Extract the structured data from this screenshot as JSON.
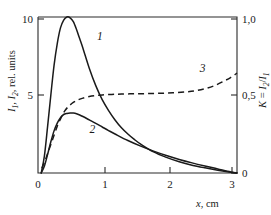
{
  "figure": {
    "background_color": "#ffffff",
    "line_color": "#1a1a1a"
  },
  "axes": {
    "x": {
      "label_var": "x",
      "label_unit": ", cm",
      "ticks": [
        "0",
        "1",
        "2",
        "3"
      ],
      "tick_values": [
        0,
        1,
        2,
        3
      ],
      "range": [
        0,
        3.1
      ]
    },
    "y_left": {
      "label_part1": "I",
      "label_sub1": "1",
      "label_part2": ", I",
      "label_sub2": "2",
      "label_part3": ", rel. units",
      "ticks": [
        "5",
        "10"
      ],
      "tick_values": [
        5,
        10
      ],
      "range": [
        0,
        10
      ]
    },
    "y_right": {
      "label_k": "K",
      "label_eq": " = ",
      "label_num": "I",
      "label_num_sub": "2",
      "label_slash": "/",
      "label_den": "I",
      "label_den_sub": "1",
      "ticks": [
        "0",
        "0,5",
        "1,0"
      ],
      "tick_values": [
        0,
        0.5,
        1.0
      ],
      "range": [
        0,
        1.0
      ]
    }
  },
  "curve_labels": {
    "one": "1",
    "two": "2",
    "three": "3"
  },
  "chart_data": {
    "type": "line",
    "title": "",
    "xlabel": "x, cm",
    "ylabel": "I1, I2, rel. units",
    "ylabel_right": "K = I2/I1",
    "xlim": [
      0,
      3.1
    ],
    "ylim": [
      0,
      10
    ],
    "ylim_right": [
      0,
      1.0
    ],
    "grid": false,
    "legend": "inline curve numbers",
    "series": [
      {
        "name": "1",
        "style": "solid",
        "axis": "left",
        "label_position": {
          "x": 0.92,
          "y": 8.55
        },
        "x": [
          0.05,
          0.1,
          0.15,
          0.2,
          0.25,
          0.3,
          0.35,
          0.4,
          0.45,
          0.5,
          0.55,
          0.6,
          0.65,
          0.7,
          0.8,
          0.9,
          1.0,
          1.1,
          1.2,
          1.3,
          1.4,
          1.5,
          1.6,
          1.8,
          2.0,
          2.2,
          2.4,
          2.6,
          2.8,
          3.0,
          3.1
        ],
        "y": [
          0.0,
          1.1,
          3.0,
          5.0,
          6.9,
          8.3,
          9.3,
          9.8,
          10.0,
          9.95,
          9.7,
          9.2,
          8.6,
          8.0,
          6.7,
          5.6,
          4.7,
          4.0,
          3.4,
          2.9,
          2.5,
          2.15,
          1.85,
          1.35,
          1.0,
          0.72,
          0.5,
          0.33,
          0.18,
          0.05,
          0.0
        ]
      },
      {
        "name": "2",
        "style": "solid",
        "axis": "left",
        "label_position": {
          "x": 0.8,
          "y": 2.55
        },
        "x": [
          0.05,
          0.1,
          0.15,
          0.2,
          0.25,
          0.3,
          0.35,
          0.4,
          0.45,
          0.5,
          0.55,
          0.6,
          0.65,
          0.7,
          0.8,
          0.9,
          1.0,
          1.1,
          1.2,
          1.4,
          1.6,
          1.8,
          2.0,
          2.2,
          2.4,
          2.6,
          2.8,
          3.0,
          3.1
        ],
        "y": [
          0.0,
          0.45,
          1.2,
          2.0,
          2.7,
          3.2,
          3.55,
          3.75,
          3.82,
          3.85,
          3.84,
          3.8,
          3.72,
          3.62,
          3.4,
          3.18,
          2.95,
          2.72,
          2.5,
          2.08,
          1.72,
          1.4,
          1.12,
          0.87,
          0.65,
          0.45,
          0.26,
          0.07,
          0.0
        ]
      },
      {
        "name": "3",
        "style": "dashed",
        "axis": "right",
        "label_position": {
          "x": 2.52,
          "y": 0.645
        },
        "x": [
          0.06,
          0.12,
          0.18,
          0.24,
          0.3,
          0.36,
          0.42,
          0.48,
          0.55,
          0.62,
          0.7,
          0.8,
          0.9,
          1.0,
          1.15,
          1.3,
          1.5,
          1.7,
          1.9,
          2.1,
          2.3,
          2.45,
          2.6,
          2.75,
          2.9,
          3.0,
          3.1
        ],
        "y": [
          0.03,
          0.09,
          0.16,
          0.23,
          0.3,
          0.355,
          0.4,
          0.428,
          0.452,
          0.468,
          0.48,
          0.49,
          0.496,
          0.5,
          0.504,
          0.506,
          0.508,
          0.509,
          0.511,
          0.514,
          0.52,
          0.527,
          0.54,
          0.56,
          0.59,
          0.612,
          0.64
        ]
      }
    ]
  }
}
